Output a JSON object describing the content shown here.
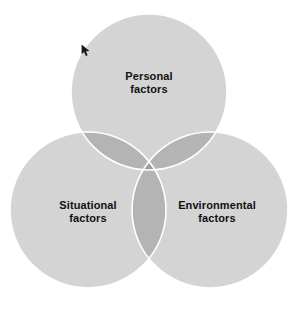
{
  "diagram": {
    "type": "venn-3-circle",
    "background_color": "#ffffff",
    "circle_fill": "#d4d4d4",
    "pair_overlap_fill": "#b4b4b4",
    "triple_overlap_fill": "#9e9e9e",
    "outline_color": "#ffffff",
    "label_color": "#111111",
    "sets": [
      {
        "id": "personal",
        "label": "Personal\nfactors",
        "label_line1": "Personal",
        "label_line2": "factors",
        "center_x": 149,
        "center_y": 92,
        "radius": 78,
        "position": "top"
      },
      {
        "id": "situational",
        "label": "Situational\nfactors",
        "label_line1": "Situational",
        "label_line2": "factors",
        "center_x": 88,
        "center_y": 210,
        "radius": 78,
        "position": "bottom-left"
      },
      {
        "id": "environmental",
        "label": "Environmental\nfactors",
        "label_line1": "Environmental",
        "label_line2": "factors",
        "center_x": 210,
        "center_y": 210,
        "radius": 78,
        "position": "bottom-right"
      }
    ],
    "annotations": [
      {
        "id": "pointer",
        "name": "mouse-pointer-icon",
        "x": 81,
        "y": 44,
        "color": "#1a1a1a"
      }
    ]
  }
}
